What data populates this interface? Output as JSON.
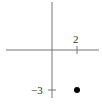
{
  "diagram": {
    "type": "coordinate-plane",
    "axes": {
      "x_axis": "horizontal",
      "y_axis": "vertical",
      "color": "#666666"
    },
    "ticks": {
      "x": {
        "value": 2,
        "label": "2"
      },
      "y": {
        "value": -3,
        "label": "−3"
      }
    },
    "point": {
      "x": 2,
      "y": -3,
      "color": "#000000"
    }
  }
}
